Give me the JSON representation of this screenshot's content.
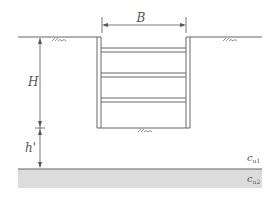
{
  "diagram": {
    "labels": {
      "width": "B",
      "depth": "H",
      "depth_below": "h'",
      "cu1_main": "c",
      "cu1_sub": "u1",
      "cu2_main": "c",
      "cu2_sub": "u2"
    },
    "struts_count": 3,
    "colors": {
      "line": "#6b6b6b",
      "stratum_fill": "#d9d9d9",
      "text": "#555555"
    }
  }
}
